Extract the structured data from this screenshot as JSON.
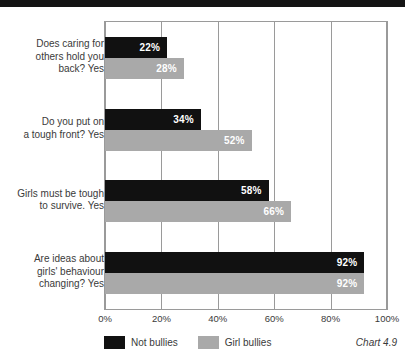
{
  "decor": {
    "top_band_color": "#141414"
  },
  "chart_data": {
    "type": "bar",
    "orientation": "horizontal",
    "title": "",
    "subtitle": "",
    "xlabel": "",
    "ylabel": "",
    "xlim": [
      0,
      100
    ],
    "xticks": [
      "0%",
      "20%",
      "40%",
      "60%",
      "80%",
      "100%"
    ],
    "xtick_values": [
      0,
      20,
      40,
      60,
      80,
      100
    ],
    "grid": true,
    "grid_axis": "x",
    "legend_position": "bottom-left",
    "categories": [
      "Does caring for\nothers hold you\nback? Yes",
      "Do you put on\na tough front? Yes",
      "Girls must be tough\nto survive. Yes",
      "Are ideas about\ngirls' behaviour\nchanging? Yes"
    ],
    "series": [
      {
        "name": "Not bullies",
        "color": "#111111",
        "values": [
          22,
          34,
          58,
          92
        ],
        "labels": [
          "22%",
          "34%",
          "58%",
          "92%"
        ]
      },
      {
        "name": "Girl bullies",
        "color": "#a9a9a9",
        "values": [
          28,
          52,
          66,
          92
        ],
        "labels": [
          "28%",
          "52%",
          "66%",
          "92%"
        ]
      }
    ],
    "caption": "Chart 4.9"
  }
}
